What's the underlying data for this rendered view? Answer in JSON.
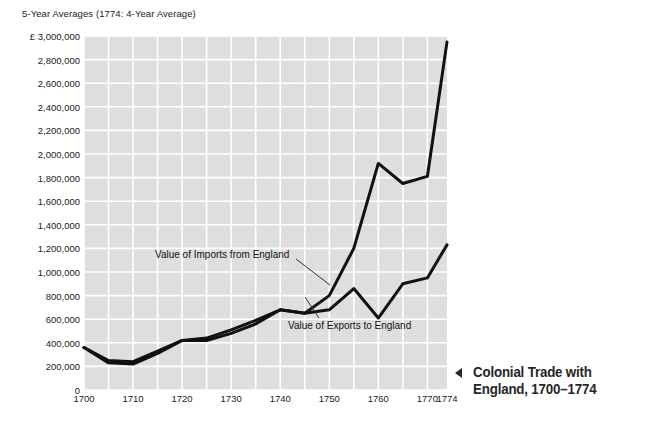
{
  "chart_data": {
    "type": "line",
    "title": "5-Year Averages (1774: 4-Year Average)",
    "xlabel": "",
    "ylabel": "",
    "currency_symbol": "£",
    "xlim": [
      1700,
      1774
    ],
    "ylim": [
      0,
      3000000
    ],
    "grid": true,
    "grid_color": "#ffffff",
    "plot_background": "#dedede",
    "series_color": "#111111",
    "legend_position": "inline-annotations",
    "x_ticks": [
      1700,
      1710,
      1720,
      1730,
      1740,
      1750,
      1760,
      1770,
      1774
    ],
    "x_tick_labels": [
      "1700",
      "1710",
      "1720",
      "1730",
      "1740",
      "1750",
      "1760",
      "1770",
      "1774"
    ],
    "y_ticks": [
      0,
      200000,
      400000,
      600000,
      800000,
      1000000,
      1200000,
      1400000,
      1600000,
      1800000,
      2000000,
      2200000,
      2400000,
      2600000,
      2800000,
      3000000
    ],
    "y_tick_labels": [
      "0",
      "200,000",
      "400,000",
      "600,000",
      "800,000",
      "1,000,000",
      "1,200,000",
      "1,400,000",
      "1,600,000",
      "1,800,000",
      "2,000,000",
      "2,200,000",
      "2,400,000",
      "2,600,000",
      "2,800,000",
      "£ 3,000,000"
    ],
    "x": [
      1700,
      1705,
      1710,
      1715,
      1720,
      1725,
      1730,
      1735,
      1740,
      1745,
      1750,
      1755,
      1760,
      1765,
      1770,
      1774
    ],
    "series": [
      {
        "name": "Value of Imports from England",
        "label": "Value of Imports from England",
        "values": [
          360000,
          230000,
          220000,
          310000,
          420000,
          420000,
          480000,
          560000,
          680000,
          650000,
          800000,
          1200000,
          1920000,
          1750000,
          1810000,
          2950000
        ]
      },
      {
        "name": "Value of Exports to England",
        "label": "Value of Exports to England",
        "values": [
          360000,
          250000,
          240000,
          330000,
          420000,
          440000,
          510000,
          590000,
          680000,
          650000,
          680000,
          860000,
          610000,
          900000,
          950000,
          1230000
        ]
      }
    ]
  },
  "caption": {
    "arrow_glyph": "◀",
    "line1": "Colonial Trade with",
    "line2": "England, 1700–1774"
  }
}
